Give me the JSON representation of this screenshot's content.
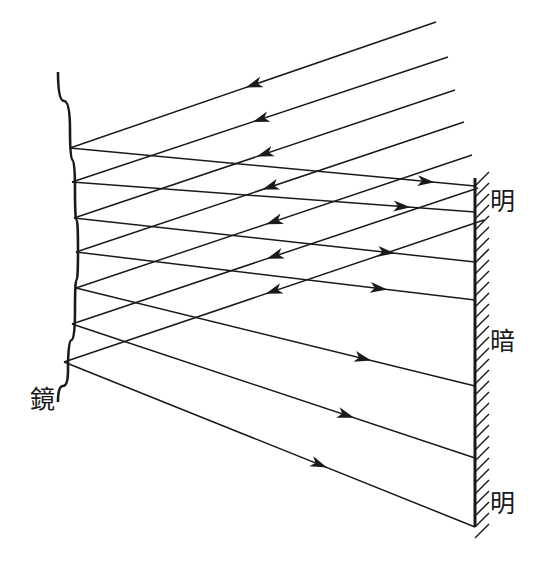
{
  "figure": {
    "title": "",
    "type": "optics-ray-diagram",
    "canvas": {
      "width": 552,
      "height": 570,
      "background": "#ffffff"
    },
    "stroke_color": "#1a1a1a",
    "labels": [
      {
        "id": "mirror-label",
        "text": "鏡",
        "meaning": "mirror",
        "x": 30,
        "y": 408
      },
      {
        "id": "screen-label-bright-top",
        "text": "明",
        "meaning": "bright",
        "x": 490,
        "y": 210
      },
      {
        "id": "screen-label-dark",
        "text": "暗",
        "meaning": "dark",
        "x": 490,
        "y": 350
      },
      {
        "id": "screen-label-bright-bottom",
        "text": "明",
        "meaning": "bright",
        "x": 490,
        "y": 512
      }
    ],
    "mirror": {
      "name": "stepped-curved-mirror",
      "hatched": true,
      "hatch_angle": 45,
      "surface_points": [
        {
          "x": 58,
          "y": 72
        },
        {
          "x": 70,
          "y": 130
        },
        {
          "x": 75,
          "y": 190
        },
        {
          "x": 78,
          "y": 250
        },
        {
          "x": 75,
          "y": 310
        },
        {
          "x": 68,
          "y": 370
        },
        {
          "x": 58,
          "y": 402
        }
      ],
      "steps": [
        {
          "id": "step-upper",
          "left": 36,
          "top": 130,
          "bottom": 196
        },
        {
          "id": "step-lower",
          "left": 31,
          "top": 262,
          "bottom": 312
        }
      ]
    },
    "screen": {
      "name": "projection-screen",
      "x": 475,
      "y_top": 178,
      "y_bottom": 527,
      "hatched": true,
      "hatch_side": "right",
      "bands": [
        {
          "label": "明",
          "y_start": 178,
          "y_end": 262
        },
        {
          "label": "暗",
          "y_start": 262,
          "y_end": 458
        },
        {
          "label": "明",
          "y_start": 458,
          "y_end": 527
        }
      ]
    },
    "incident_rays": {
      "name": "incident-parallel-rays",
      "direction": "upper-right to lower-left",
      "count": 7,
      "arrow_direction": "toward-mirror",
      "rays": [
        {
          "id": "incident-1",
          "x1": 436,
          "y1": 22,
          "x2": 70,
          "y2": 148,
          "arrow_t": 0.52
        },
        {
          "id": "incident-2",
          "x1": 448,
          "y1": 57,
          "x2": 72,
          "y2": 182,
          "arrow_t": 0.52
        },
        {
          "id": "incident-3",
          "x1": 455,
          "y1": 90,
          "x2": 74,
          "y2": 218,
          "arrow_t": 0.52
        },
        {
          "id": "incident-4",
          "x1": 464,
          "y1": 122,
          "x2": 76,
          "y2": 252,
          "arrow_t": 0.52
        },
        {
          "id": "incident-5",
          "x1": 472,
          "y1": 155,
          "x2": 76,
          "y2": 288,
          "arrow_t": 0.52
        },
        {
          "id": "incident-6",
          "x1": 478,
          "y1": 188,
          "x2": 72,
          "y2": 324,
          "arrow_t": 0.52
        },
        {
          "id": "incident-7",
          "x1": 484,
          "y1": 220,
          "x2": 64,
          "y2": 362,
          "arrow_t": 0.52
        }
      ]
    },
    "reflected_rays": {
      "name": "reflected-rays",
      "direction": "mirror to screen",
      "count": 7,
      "arrow_direction": "toward-screen",
      "rays": [
        {
          "id": "reflected-1",
          "x1": 70,
          "y1": 148,
          "x2": 475,
          "y2": 186,
          "arrow_t": 0.9
        },
        {
          "id": "reflected-2",
          "x1": 72,
          "y1": 182,
          "x2": 475,
          "y2": 212,
          "arrow_t": 0.84
        },
        {
          "id": "reflected-3",
          "x1": 74,
          "y1": 218,
          "x2": 475,
          "y2": 262,
          "arrow_t": 0.8
        },
        {
          "id": "reflected-4",
          "x1": 76,
          "y1": 252,
          "x2": 475,
          "y2": 300,
          "arrow_t": 0.78
        },
        {
          "id": "reflected-5",
          "x1": 76,
          "y1": 288,
          "x2": 475,
          "y2": 386,
          "arrow_t": 0.74
        },
        {
          "id": "reflected-6",
          "x1": 72,
          "y1": 324,
          "x2": 475,
          "y2": 458,
          "arrow_t": 0.7
        },
        {
          "id": "reflected-7",
          "x1": 64,
          "y1": 362,
          "x2": 475,
          "y2": 527,
          "arrow_t": 0.64
        }
      ]
    }
  }
}
